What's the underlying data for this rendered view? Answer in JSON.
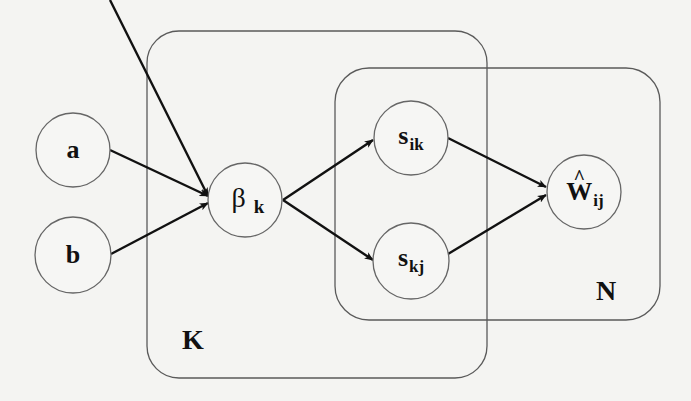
{
  "diagram": {
    "type": "plate-notation-graphical-model",
    "colors": {
      "background": "#f4f4f2",
      "edge": "#111111",
      "node_stroke": "#666666",
      "plate_stroke": "#5a5a5a"
    },
    "plates": [
      {
        "id": "K",
        "label": "K"
      },
      {
        "id": "N",
        "label": "N"
      }
    ],
    "nodes": [
      {
        "id": "a",
        "symbol": "a",
        "subscript": ""
      },
      {
        "id": "b",
        "symbol": "b",
        "subscript": ""
      },
      {
        "id": "beta_k",
        "symbol": "β",
        "subscript": "k"
      },
      {
        "id": "s_ik",
        "symbol": "s",
        "subscript": "ik"
      },
      {
        "id": "s_kj",
        "symbol": "s",
        "subscript": "kj"
      },
      {
        "id": "W_hat_ij",
        "symbol": "W",
        "hat": "^",
        "subscript": "ij"
      }
    ],
    "edges": [
      {
        "from": "a",
        "to": "beta_k"
      },
      {
        "from": "b",
        "to": "beta_k"
      },
      {
        "from": "beta_k",
        "to": "s_ik"
      },
      {
        "from": "beta_k",
        "to": "s_kj"
      },
      {
        "from": "s_ik",
        "to": "W_hat_ij"
      },
      {
        "from": "s_kj",
        "to": "W_hat_ij"
      }
    ]
  }
}
